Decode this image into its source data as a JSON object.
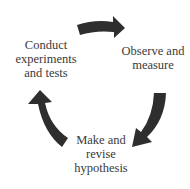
{
  "diagram": {
    "type": "cycle",
    "arrow_color": "#2e2e2e",
    "text_color": "#3a3a3a",
    "steps": [
      {
        "id": "observe",
        "lines": [
          "Observe and",
          "measure"
        ]
      },
      {
        "id": "hypothesis",
        "lines": [
          "Make and",
          "revise",
          "hypothesis"
        ]
      },
      {
        "id": "experiment",
        "lines": [
          "Conduct",
          "experiments",
          "and tests"
        ]
      }
    ],
    "arrows": [
      {
        "from": "experiment",
        "to": "observe",
        "position": "top",
        "icon": "curved-arrow-right"
      },
      {
        "from": "observe",
        "to": "hypothesis",
        "position": "right",
        "icon": "curved-arrow-down-left"
      },
      {
        "from": "hypothesis",
        "to": "experiment",
        "position": "left",
        "icon": "curved-arrow-up"
      }
    ]
  }
}
